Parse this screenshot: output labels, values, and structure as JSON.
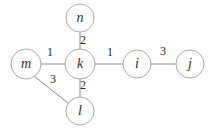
{
  "figure": {
    "kind": "weighted-undirected-graph",
    "width": 210,
    "height": 129,
    "background_color": "#ffffff",
    "node_stroke_color": "#a8a8a8",
    "node_fill_color": "#ffffff",
    "edge_stroke_color": "#8a8a8a",
    "label_color": "#2b2b2b",
    "weight_color": "#1e1e1e"
  },
  "nodes": [
    {
      "id": "n",
      "label": "n",
      "cx": 80,
      "cy": 18,
      "r": 14
    },
    {
      "id": "m",
      "label": "m",
      "cx": 26,
      "cy": 64,
      "r": 15
    },
    {
      "id": "k",
      "label": "k",
      "cx": 80,
      "cy": 64,
      "r": 15
    },
    {
      "id": "i",
      "label": "i",
      "cx": 137,
      "cy": 64,
      "r": 14
    },
    {
      "id": "j",
      "label": "j",
      "cx": 190,
      "cy": 64,
      "r": 14
    },
    {
      "id": "l",
      "label": "l",
      "cx": 80,
      "cy": 111,
      "r": 14
    }
  ],
  "edges": [
    {
      "source": "n",
      "target": "k",
      "weight": "2",
      "x1": 80,
      "y1": 32,
      "x2": 80,
      "y2": 49,
      "label_x": 83,
      "label_y": 41
    },
    {
      "source": "m",
      "target": "k",
      "weight": "1",
      "x1": 41,
      "y1": 64,
      "x2": 65,
      "y2": 64,
      "label_x": 50,
      "label_y": 53
    },
    {
      "source": "k",
      "target": "i",
      "weight": "1",
      "x1": 95,
      "y1": 64,
      "x2": 123,
      "y2": 64,
      "label_x": 110,
      "label_y": 53
    },
    {
      "source": "i",
      "target": "j",
      "weight": "3",
      "x1": 151,
      "y1": 64,
      "x2": 176,
      "y2": 64,
      "label_x": 163,
      "label_y": 52
    },
    {
      "source": "k",
      "target": "l",
      "weight": "2",
      "x1": 80,
      "y1": 79,
      "x2": 80,
      "y2": 97,
      "label_x": 83,
      "label_y": 86
    },
    {
      "source": "m",
      "target": "l",
      "weight": "3",
      "x1": 34,
      "y1": 76,
      "x2": 68,
      "y2": 103,
      "label_x": 53,
      "label_y": 80
    }
  ]
}
